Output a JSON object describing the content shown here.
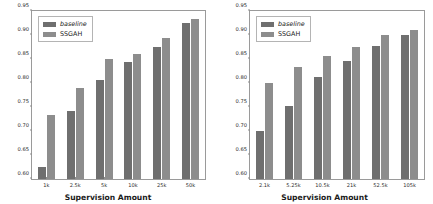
{
  "figure": {
    "background_color": "#ffffff",
    "panel_count": 2
  },
  "colors": {
    "baseline": "#6f6f6f",
    "ssgah": "#8d8d8d",
    "axis": "#9a9a9a",
    "text": "#1a1a1a"
  },
  "legend": {
    "baseline_label": "baseline",
    "ssgah_label": "SSGAH"
  },
  "chart_data": [
    {
      "type": "bar",
      "title": "",
      "xlabel": "Supervision Amount",
      "ylabel": "mean Average Precision",
      "categories": [
        "1k",
        "2.5k",
        "5k",
        "10k",
        "25k",
        "50k"
      ],
      "series": [
        {
          "name": "baseline",
          "values": [
            0.626,
            0.742,
            0.806,
            0.844,
            0.874,
            0.926
          ]
        },
        {
          "name": "SSGAH",
          "values": [
            0.733,
            0.79,
            0.851,
            0.861,
            0.894,
            0.934
          ]
        }
      ],
      "ylim": [
        0.6,
        0.95
      ],
      "yticks": [
        0.6,
        0.65,
        0.7,
        0.75,
        0.8,
        0.85,
        0.9,
        0.95
      ],
      "ytick_labels": [
        "0.60",
        "0.65",
        "0.70",
        "0.75",
        "0.80",
        "0.85",
        "0.90",
        "0.95"
      ],
      "grid": false,
      "legend_position": "upper-left"
    },
    {
      "type": "bar",
      "title": "",
      "xlabel": "Supervision Amount",
      "ylabel": "mean Average Precision",
      "categories": [
        "2.1k",
        "5.25k",
        "10.5k",
        "21k",
        "52.5k",
        "105k"
      ],
      "series": [
        {
          "name": "baseline",
          "values": [
            0.701,
            0.752,
            0.812,
            0.845,
            0.878,
            0.9
          ]
        },
        {
          "name": "SSGAH",
          "values": [
            0.801,
            0.833,
            0.856,
            0.875,
            0.901,
            0.91
          ]
        }
      ],
      "ylim": [
        0.6,
        0.95
      ],
      "yticks": [
        0.6,
        0.65,
        0.7,
        0.75,
        0.8,
        0.85,
        0.9,
        0.95
      ],
      "ytick_labels": [
        "0.60",
        "0.65",
        "0.70",
        "0.75",
        "0.80",
        "0.85",
        "0.90",
        "0.95"
      ],
      "grid": false,
      "legend_position": "upper-left"
    }
  ]
}
